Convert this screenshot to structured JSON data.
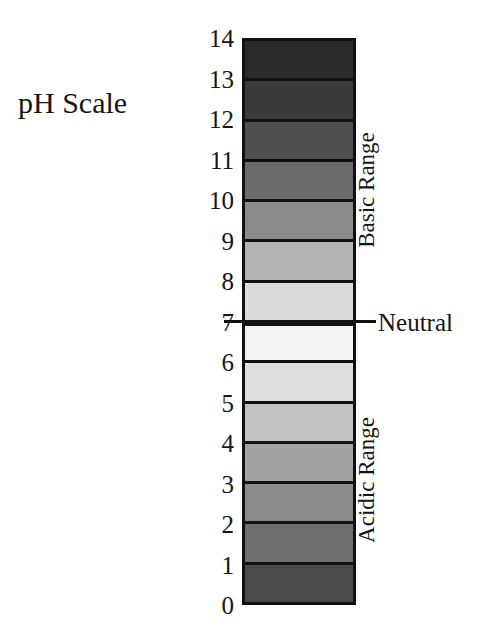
{
  "title": "pH Scale",
  "top_caption": "",
  "scale": {
    "min": 0,
    "max": 14,
    "neutral": 7,
    "tick_labels": [
      "14",
      "13",
      "12",
      "11",
      "10",
      "9",
      "8",
      "7",
      "6",
      "5",
      "4",
      "3",
      "2",
      "1",
      "0"
    ],
    "band_count": 14,
    "border_color": "#111111",
    "divider_color": "#111111"
  },
  "labels": {
    "basic_range": "Basic Range",
    "neutral": "Neutral",
    "acidic_range": "Acidic Range"
  },
  "chart_data": {
    "type": "bar",
    "title": "pH Scale",
    "xlabel": "",
    "ylabel": "pH",
    "ylim": [
      0,
      14
    ],
    "orientation": "vertical",
    "grid": false,
    "legend_position": "right",
    "categories": [
      "14",
      "13",
      "12",
      "11",
      "10",
      "9",
      "8",
      "7",
      "6",
      "5",
      "4",
      "3",
      "2",
      "1",
      "0"
    ],
    "bands": [
      {
        "ph_top": 14,
        "ph_bottom": 13,
        "fill": "#2b2b2b",
        "region": "Basic Range"
      },
      {
        "ph_top": 13,
        "ph_bottom": 12,
        "fill": "#3a3a3a",
        "region": "Basic Range"
      },
      {
        "ph_top": 12,
        "ph_bottom": 11,
        "fill": "#4f4f4f",
        "region": "Basic Range"
      },
      {
        "ph_top": 11,
        "ph_bottom": 10,
        "fill": "#6b6b6b",
        "region": "Basic Range"
      },
      {
        "ph_top": 10,
        "ph_bottom": 9,
        "fill": "#8c8c8c",
        "region": "Basic Range"
      },
      {
        "ph_top": 9,
        "ph_bottom": 8,
        "fill": "#b4b4b4",
        "region": "Basic Range"
      },
      {
        "ph_top": 8,
        "ph_bottom": 7,
        "fill": "#dcdcdc",
        "region": "Basic Range"
      },
      {
        "ph_top": 7,
        "ph_bottom": 6,
        "fill": "#f2f2f2",
        "region": "Neutral"
      },
      {
        "ph_top": 6,
        "ph_bottom": 5,
        "fill": "#dddddd",
        "region": "Acidic Range"
      },
      {
        "ph_top": 5,
        "ph_bottom": 4,
        "fill": "#c2c2c2",
        "region": "Acidic Range"
      },
      {
        "ph_top": 4,
        "ph_bottom": 3,
        "fill": "#a3a3a3",
        "region": "Acidic Range"
      },
      {
        "ph_top": 3,
        "ph_bottom": 2,
        "fill": "#8a8a8a",
        "region": "Acidic Range"
      },
      {
        "ph_top": 2,
        "ph_bottom": 1,
        "fill": "#6e6e6e",
        "region": "Acidic Range"
      },
      {
        "ph_top": 1,
        "ph_bottom": 0,
        "fill": "#4a4a4a",
        "region": "Acidic Range"
      }
    ],
    "annotations": [
      {
        "text": "Basic Range",
        "ph_range": [
          7,
          14
        ]
      },
      {
        "text": "Neutral",
        "ph": 7
      },
      {
        "text": "Acidic Range",
        "ph_range": [
          0,
          7
        ]
      }
    ]
  }
}
